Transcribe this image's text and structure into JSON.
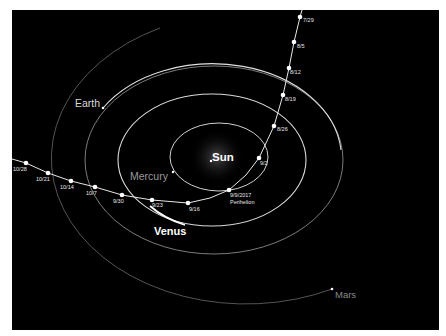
{
  "diagram": {
    "bodies": [
      {
        "name": "Sun",
        "label": "Sun"
      },
      {
        "name": "Mercury",
        "label": "Mercury"
      },
      {
        "name": "Venus",
        "label": "Venus"
      },
      {
        "name": "Earth",
        "label": "Earth"
      },
      {
        "name": "Mars",
        "label": "Mars"
      }
    ],
    "trajectory": {
      "points": [
        {
          "label": "7/29"
        },
        {
          "label": "8/5"
        },
        {
          "label": "8/12"
        },
        {
          "label": "8/19"
        },
        {
          "label": "8/26"
        },
        {
          "label": "9/2"
        },
        {
          "label": "9/9/2017",
          "sublabel": "Perihelion"
        },
        {
          "label": "9/16"
        },
        {
          "label": "9/23"
        },
        {
          "label": "9/30"
        },
        {
          "label": "10/7"
        },
        {
          "label": "10/14"
        },
        {
          "label": "10/21"
        },
        {
          "label": "10/28"
        }
      ]
    },
    "colors": {
      "background": "#000000",
      "frame": "#ffffff",
      "orbit_bright": "#e6e6e6",
      "orbit_faint": "#6e6e6e",
      "mars_label": "#8a8a8a",
      "mercury_label": "#9a9a9a"
    }
  }
}
